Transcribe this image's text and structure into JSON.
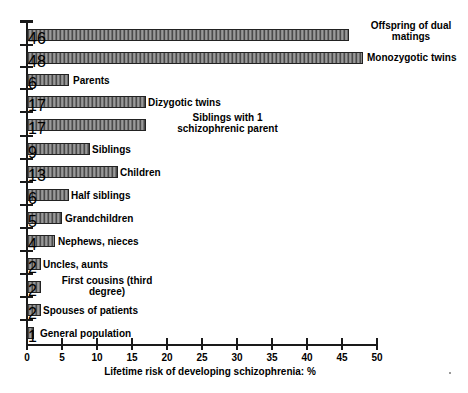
{
  "chart_data": {
    "type": "bar",
    "orientation": "horizontal",
    "title": "",
    "xlabel": "Lifetime risk of developing schizophrenia: %",
    "ylabel": "",
    "xlim": [
      0,
      50
    ],
    "xticks": [
      0,
      5,
      10,
      15,
      20,
      25,
      30,
      35,
      40,
      45,
      50
    ],
    "xtick_labels": [
      "0",
      "5",
      "10",
      "15",
      "20",
      "25",
      "30",
      "35",
      "40",
      "45",
      "50"
    ],
    "grid": false,
    "legend": false,
    "categories": [
      "Offspring of dual matings",
      "Monozygotic twins",
      "Parents",
      "Dizygotic twins",
      "Siblings with 1 schizophrenic parent",
      "Siblings",
      "Children",
      "Half siblings",
      "Grandchildren",
      "Nephews, nieces",
      "Uncles, aunts",
      "First cousins (third degree)",
      "Spouses of patients",
      "General population"
    ],
    "values": [
      46,
      48,
      6,
      17,
      17,
      9,
      13,
      6,
      5,
      4,
      2,
      2,
      2,
      1
    ],
    "bar_color": "#7d7d7d",
    "bar_edge_color": "#222222",
    "bar_hatch": "vertical-stripes"
  },
  "bars": [
    {
      "label": "Offspring of dual\nmatings",
      "value": 46,
      "label_align": "center",
      "label_x": 355,
      "label_y": 20,
      "label_w": 112,
      "y": 29
    },
    {
      "label": "Monozygotic twins",
      "value": 48,
      "label_align": "left",
      "label_x": 367,
      "label_y": 52,
      "label_w": 101,
      "y": 52
    },
    {
      "label": "Parents",
      "value": 6,
      "label_align": "left",
      "label_x": 73,
      "label_y": 75,
      "label_w": 120,
      "y": 74
    },
    {
      "label": "Dizygotic twins",
      "value": 17,
      "label_align": "left",
      "label_x": 148,
      "label_y": 97,
      "label_w": 120,
      "y": 96
    },
    {
      "label": "Siblings with 1\nschizophrenic parent",
      "value": 17,
      "label_align": "center",
      "label_x": 155,
      "label_y": 112,
      "label_w": 145,
      "y": 119
    },
    {
      "label": "Siblings",
      "value": 9,
      "label_align": "left",
      "label_x": 92,
      "label_y": 144,
      "label_w": 120,
      "y": 143
    },
    {
      "label": "Children",
      "value": 13,
      "label_align": "left",
      "label_x": 120,
      "label_y": 167,
      "label_w": 120,
      "y": 166
    },
    {
      "label": "Half siblings",
      "value": 6,
      "label_align": "left",
      "label_x": 71,
      "label_y": 190,
      "label_w": 120,
      "y": 189
    },
    {
      "label": "Grandchildren",
      "value": 5,
      "label_align": "left",
      "label_x": 65,
      "label_y": 213,
      "label_w": 120,
      "y": 212
    },
    {
      "label": "Nephews, nieces",
      "value": 4,
      "label_align": "left",
      "label_x": 58,
      "label_y": 236,
      "label_w": 130,
      "y": 235
    },
    {
      "label": "Uncles, aunts",
      "value": 2,
      "label_align": "left",
      "label_x": 43,
      "label_y": 259,
      "label_w": 120,
      "y": 258
    },
    {
      "label": "First cousins (third\ndegree)",
      "value": 2,
      "label_align": "center",
      "label_x": 42,
      "label_y": 275,
      "label_w": 130,
      "y": 281
    },
    {
      "label": "Spouses of patients",
      "value": 2,
      "label_align": "left",
      "label_x": 43,
      "label_y": 305,
      "label_w": 140,
      "y": 304
    },
    {
      "label": "General population",
      "value": 1,
      "label_align": "left",
      "label_x": 40,
      "label_y": 328,
      "label_w": 140,
      "y": 327
    }
  ],
  "axis": {
    "x_title": "Lifetime risk of developing schizophrenia: %",
    "ticks": [
      "0",
      "5",
      "10",
      "15",
      "20",
      "25",
      "30",
      "35",
      "40",
      "45",
      "50"
    ]
  }
}
